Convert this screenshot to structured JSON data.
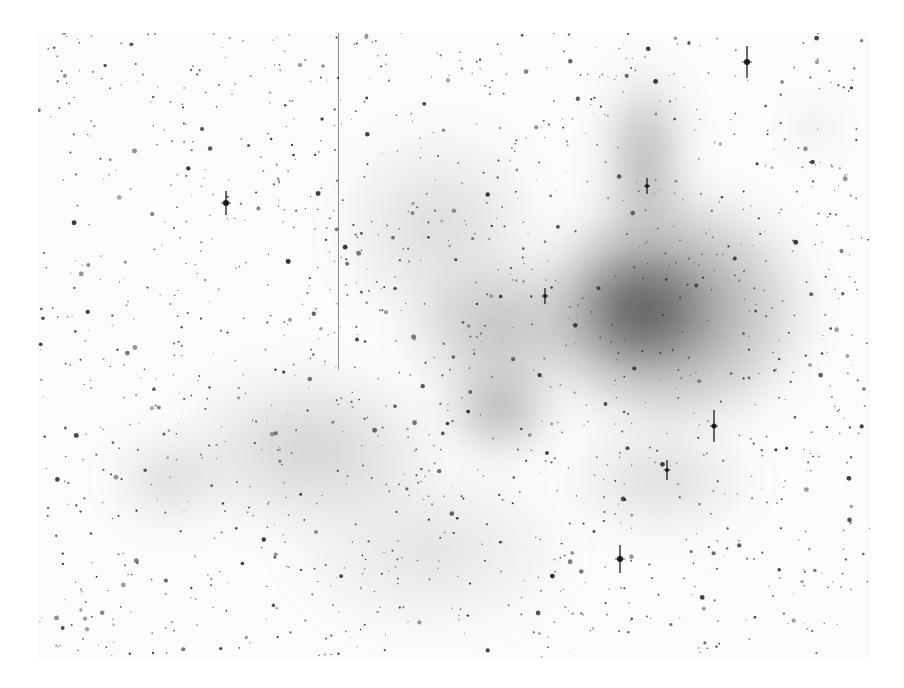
{
  "image": {
    "kind": "inverted astronomical photograph",
    "subject": "emission nebula with star field (negative, dark-on-white)",
    "background": "#ffffff",
    "frame": {
      "x": 38,
      "y": 33,
      "width": 832,
      "height": 625
    },
    "nebula_regions": [
      {
        "x": 520,
        "y": 180,
        "w": 300,
        "h": 260,
        "color": "rgba(40,40,40,0.55)"
      },
      {
        "x": 560,
        "y": 240,
        "w": 150,
        "h": 140,
        "color": "rgba(20,20,20,0.55)"
      },
      {
        "x": 600,
        "y": 60,
        "w": 90,
        "h": 200,
        "color": "rgba(50,50,50,0.40)"
      },
      {
        "x": 400,
        "y": 250,
        "w": 200,
        "h": 160,
        "color": "rgba(70,70,70,0.35)"
      },
      {
        "x": 440,
        "y": 360,
        "w": 120,
        "h": 100,
        "color": "rgba(50,50,50,0.40)"
      },
      {
        "x": 330,
        "y": 120,
        "w": 220,
        "h": 220,
        "color": "rgba(120,120,120,0.25)"
      },
      {
        "x": 170,
        "y": 360,
        "w": 280,
        "h": 180,
        "color": "rgba(110,110,110,0.30)"
      },
      {
        "x": 110,
        "y": 430,
        "w": 120,
        "h": 100,
        "color": "rgba(120,120,120,0.28)"
      },
      {
        "x": 280,
        "y": 460,
        "w": 300,
        "h": 180,
        "color": "rgba(140,140,140,0.22)"
      },
      {
        "x": 560,
        "y": 420,
        "w": 200,
        "h": 120,
        "color": "rgba(120,120,120,0.25)"
      },
      {
        "x": 800,
        "y": 115,
        "w": 30,
        "h": 25,
        "color": "rgba(80,80,80,0.45)"
      }
    ],
    "bright_stars": [
      {
        "x": 747,
        "y": 62,
        "r": 3,
        "spike": 16
      },
      {
        "x": 226,
        "y": 203,
        "r": 3,
        "spike": 12
      },
      {
        "x": 714,
        "y": 426,
        "r": 2.5,
        "spike": 16
      },
      {
        "x": 667,
        "y": 470,
        "r": 2,
        "spike": 10
      },
      {
        "x": 620,
        "y": 559,
        "r": 3,
        "spike": 14
      },
      {
        "x": 647,
        "y": 186,
        "r": 2,
        "spike": 8
      },
      {
        "x": 545,
        "y": 296,
        "r": 2,
        "spike": 8
      }
    ],
    "artifacts": [
      {
        "type": "vertical-streak",
        "x": 338,
        "y1": 33,
        "y2": 370
      }
    ]
  }
}
